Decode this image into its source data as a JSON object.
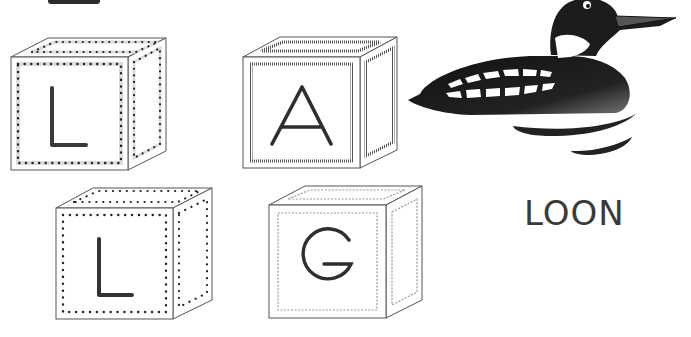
{
  "worksheet": {
    "word": "LOON",
    "blocks": [
      {
        "letter": "L",
        "border_style": "dotted-band"
      },
      {
        "letter": "A",
        "border_style": "hatched"
      },
      {
        "letter": "L",
        "border_style": "dots"
      },
      {
        "letter": "G",
        "border_style": "wavy"
      }
    ],
    "picture": "loon-icon"
  }
}
